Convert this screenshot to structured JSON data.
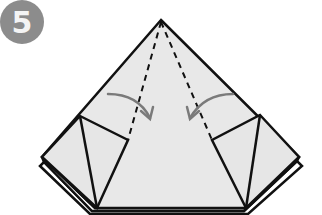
{
  "step": {
    "number": "5"
  },
  "colors": {
    "paper": "#e8e8e8",
    "outline": "#111111",
    "arrow": "#7a7a7a",
    "badge": "#8c8c8c"
  },
  "diagram": {
    "type": "origami-step",
    "elements": [
      "outer-triangle",
      "left-flap",
      "right-flap",
      "valley-fold-lines",
      "fold-arrows"
    ]
  }
}
